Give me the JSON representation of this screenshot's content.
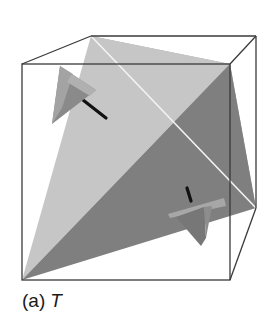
{
  "figure": {
    "caption_label": "(a)",
    "caption_symbol": "T",
    "colors": {
      "cube_edge": "#3a3a3a",
      "light_face": "#c4c4c4",
      "dark_face": "#7e7e7e",
      "back_face": "#a8a8a8",
      "hidden_edge": "#ffffff",
      "axis_rod": "#111111",
      "marker_light": "#9a9a9a",
      "marker_dark": "#6e6e6e"
    }
  }
}
